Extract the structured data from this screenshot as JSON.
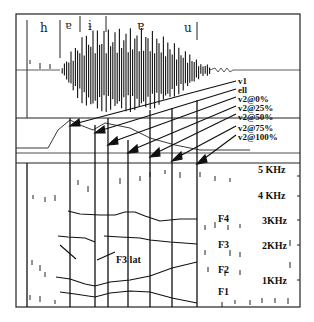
{
  "figure": {
    "phoneme_labels": [
      {
        "id": "h",
        "text": "h"
      },
      {
        "id": "v1",
        "text": "ɐ"
      },
      {
        "id": "ell",
        "text": "ɨ"
      },
      {
        "id": "v2",
        "text": "ɐ"
      },
      {
        "id": "u",
        "text": "u"
      }
    ],
    "annotations": [
      {
        "id": "v1",
        "text": "v1"
      },
      {
        "id": "ell",
        "text": "ell"
      },
      {
        "id": "v2_0",
        "text": "v2@0%"
      },
      {
        "id": "v2_25",
        "text": "v2@25%"
      },
      {
        "id": "v2_50",
        "text": "v2@50%"
      },
      {
        "id": "v2_75",
        "text": "v2@75%"
      },
      {
        "id": "v2_100",
        "text": "v2@100%"
      }
    ],
    "frequency_labels": [
      {
        "id": "5k",
        "text": "5 KHz"
      },
      {
        "id": "4k",
        "text": "4 KHz"
      },
      {
        "id": "3k",
        "text": "3KHz"
      },
      {
        "id": "2k",
        "text": "2KHz"
      },
      {
        "id": "1k",
        "text": "1KHz"
      }
    ],
    "formant_labels": [
      {
        "id": "F4",
        "text": "F4"
      },
      {
        "id": "F3",
        "text": "F3"
      },
      {
        "id": "F3lat",
        "text": "F3 lat"
      },
      {
        "id": "F2",
        "text": "F2"
      },
      {
        "id": "F1",
        "text": "F1"
      }
    ],
    "colors": {
      "ink": "#111111",
      "background": "#ffffff"
    }
  }
}
